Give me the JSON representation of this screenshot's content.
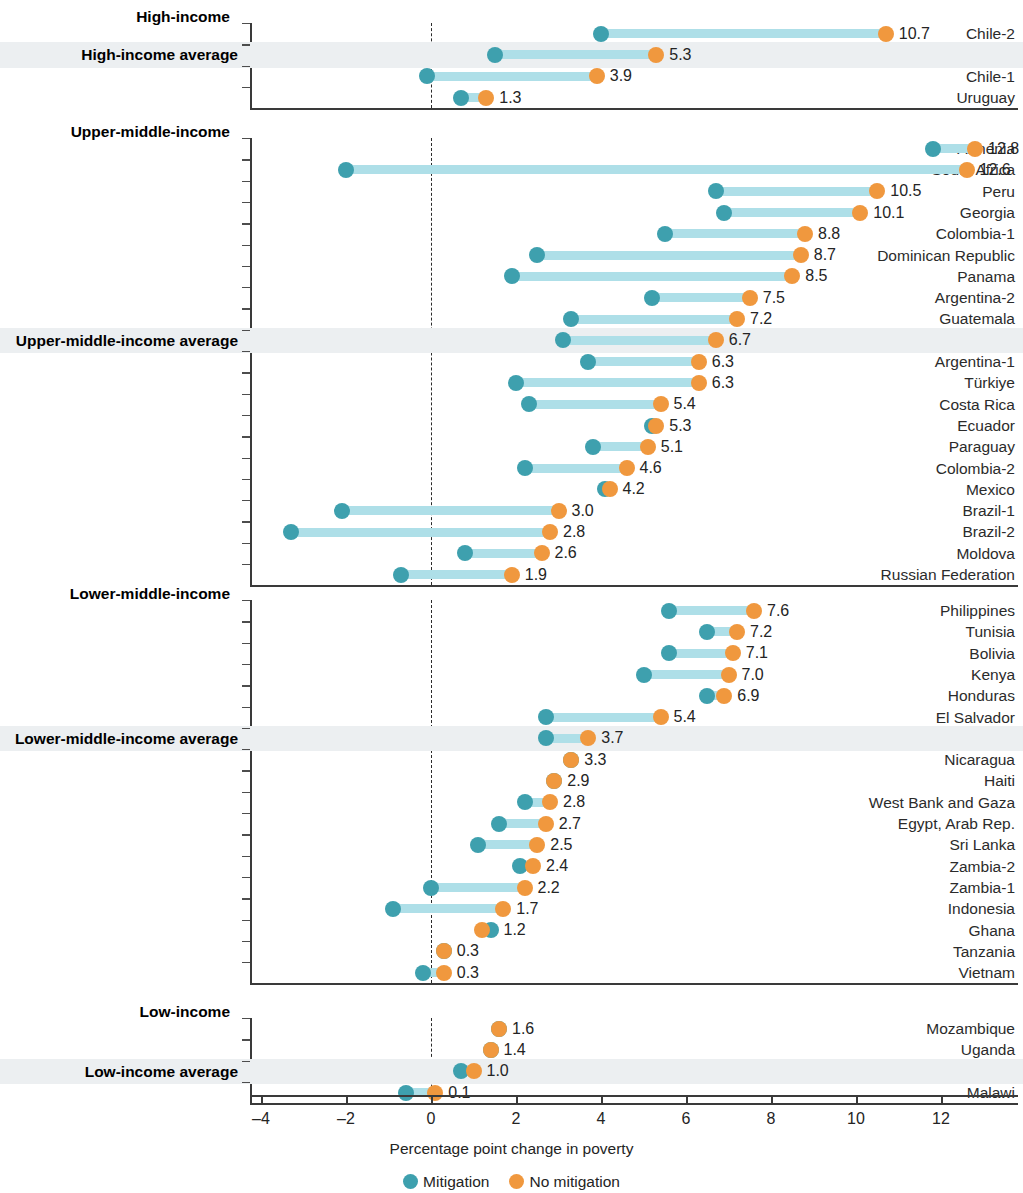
{
  "chart_data": {
    "type": "dumbbell",
    "title": "",
    "xlabel": "Percentage point change in poverty",
    "ylabel": "",
    "xlim": [
      -4.6,
      13.3
    ],
    "xticks": [
      -4,
      -2,
      0,
      2,
      4,
      6,
      8,
      10,
      12
    ],
    "xticklabels": [
      "–4",
      "–2",
      "0",
      "2",
      "4",
      "6",
      "8",
      "10",
      "12"
    ],
    "grid": false,
    "zero_reference_line": true,
    "legend_position": "bottom",
    "series": [
      {
        "name": "Mitigation",
        "color": "#3ea0ae"
      },
      {
        "name": "No mitigation",
        "color": "#f0983e"
      }
    ],
    "connector_color": "#aedfe8",
    "highlight_band_color": "#eceff1",
    "groups": [
      {
        "name": "High-income",
        "rows": [
          {
            "label": "Chile-2",
            "mitigation": 4.0,
            "no_mitigation": 10.7,
            "value_label": "10.7",
            "average": false
          },
          {
            "label": "High-income average",
            "mitigation": 1.5,
            "no_mitigation": 5.3,
            "value_label": "5.3",
            "average": true
          },
          {
            "label": "Chile-1",
            "mitigation": -0.1,
            "no_mitigation": 3.9,
            "value_label": "3.9",
            "average": false
          },
          {
            "label": "Uruguay",
            "mitigation": 0.7,
            "no_mitigation": 1.3,
            "value_label": "1.3",
            "average": false
          }
        ]
      },
      {
        "name": "Upper-middle-income",
        "rows": [
          {
            "label": "Armenia",
            "mitigation": 11.8,
            "no_mitigation": 12.8,
            "value_label": "12.8",
            "average": false
          },
          {
            "label": "South Africa",
            "mitigation": -2.0,
            "no_mitigation": 12.6,
            "value_label": "12.6",
            "average": false
          },
          {
            "label": "Peru",
            "mitigation": 6.7,
            "no_mitigation": 10.5,
            "value_label": "10.5",
            "average": false
          },
          {
            "label": "Georgia",
            "mitigation": 6.9,
            "no_mitigation": 10.1,
            "value_label": "10.1",
            "average": false
          },
          {
            "label": "Colombia-1",
            "mitigation": 5.5,
            "no_mitigation": 8.8,
            "value_label": "8.8",
            "average": false
          },
          {
            "label": "Dominican Republic",
            "mitigation": 2.5,
            "no_mitigation": 8.7,
            "value_label": "8.7",
            "average": false
          },
          {
            "label": "Panama",
            "mitigation": 1.9,
            "no_mitigation": 8.5,
            "value_label": "8.5",
            "average": false
          },
          {
            "label": "Argentina-2",
            "mitigation": 5.2,
            "no_mitigation": 7.5,
            "value_label": "7.5",
            "average": false
          },
          {
            "label": "Guatemala",
            "mitigation": 3.3,
            "no_mitigation": 7.2,
            "value_label": "7.2",
            "average": false
          },
          {
            "label": "Upper-middle-income average",
            "mitigation": 3.1,
            "no_mitigation": 6.7,
            "value_label": "6.7",
            "average": true
          },
          {
            "label": "Argentina-1",
            "mitigation": 3.7,
            "no_mitigation": 6.3,
            "value_label": "6.3",
            "average": false
          },
          {
            "label": "Türkiye",
            "mitigation": 2.0,
            "no_mitigation": 6.3,
            "value_label": "6.3",
            "average": false
          },
          {
            "label": "Costa Rica",
            "mitigation": 2.3,
            "no_mitigation": 5.4,
            "value_label": "5.4",
            "average": false
          },
          {
            "label": "Ecuador",
            "mitigation": 5.2,
            "no_mitigation": 5.3,
            "value_label": "5.3",
            "average": false
          },
          {
            "label": "Paraguay",
            "mitigation": 3.8,
            "no_mitigation": 5.1,
            "value_label": "5.1",
            "average": false
          },
          {
            "label": "Colombia-2",
            "mitigation": 2.2,
            "no_mitigation": 4.6,
            "value_label": "4.6",
            "average": false
          },
          {
            "label": "Mexico",
            "mitigation": 4.1,
            "no_mitigation": 4.2,
            "value_label": "4.2",
            "average": false
          },
          {
            "label": "Brazil-1",
            "mitigation": -2.1,
            "no_mitigation": 3.0,
            "value_label": "3.0",
            "average": false
          },
          {
            "label": "Brazil-2",
            "mitigation": -3.3,
            "no_mitigation": 2.8,
            "value_label": "2.8",
            "average": false
          },
          {
            "label": "Moldova",
            "mitigation": 0.8,
            "no_mitigation": 2.6,
            "value_label": "2.6",
            "average": false
          },
          {
            "label": "Russian Federation",
            "mitigation": -0.7,
            "no_mitigation": 1.9,
            "value_label": "1.9",
            "average": false
          }
        ]
      },
      {
        "name": "Lower-middle-income",
        "rows": [
          {
            "label": "Philippines",
            "mitigation": 5.6,
            "no_mitigation": 7.6,
            "value_label": "7.6",
            "average": false
          },
          {
            "label": "Tunisia",
            "mitigation": 6.5,
            "no_mitigation": 7.2,
            "value_label": "7.2",
            "average": false
          },
          {
            "label": "Bolivia",
            "mitigation": 5.6,
            "no_mitigation": 7.1,
            "value_label": "7.1",
            "average": false
          },
          {
            "label": "Kenya",
            "mitigation": 5.0,
            "no_mitigation": 7.0,
            "value_label": "7.0",
            "average": false
          },
          {
            "label": "Honduras",
            "mitigation": 6.5,
            "no_mitigation": 6.9,
            "value_label": "6.9",
            "average": false
          },
          {
            "label": "El Salvador",
            "mitigation": 2.7,
            "no_mitigation": 5.4,
            "value_label": "5.4",
            "average": false
          },
          {
            "label": "Lower-middle-income average",
            "mitigation": 2.7,
            "no_mitigation": 3.7,
            "value_label": "3.7",
            "average": true
          },
          {
            "label": "Nicaragua",
            "mitigation": 3.3,
            "no_mitigation": 3.3,
            "value_label": "3.3",
            "average": false
          },
          {
            "label": "Haiti",
            "mitigation": 2.9,
            "no_mitigation": 2.9,
            "value_label": "2.9",
            "average": false
          },
          {
            "label": "West Bank and Gaza",
            "mitigation": 2.2,
            "no_mitigation": 2.8,
            "value_label": "2.8",
            "average": false
          },
          {
            "label": "Egypt, Arab Rep.",
            "mitigation": 1.6,
            "no_mitigation": 2.7,
            "value_label": "2.7",
            "average": false
          },
          {
            "label": "Sri Lanka",
            "mitigation": 1.1,
            "no_mitigation": 2.5,
            "value_label": "2.5",
            "average": false
          },
          {
            "label": "Zambia-2",
            "mitigation": 2.1,
            "no_mitigation": 2.4,
            "value_label": "2.4",
            "average": false
          },
          {
            "label": "Zambia-1",
            "mitigation": 0.0,
            "no_mitigation": 2.2,
            "value_label": "2.2",
            "average": false
          },
          {
            "label": "Indonesia",
            "mitigation": -0.9,
            "no_mitigation": 1.7,
            "value_label": "1.7",
            "average": false
          },
          {
            "label": "Ghana",
            "mitigation": 1.4,
            "no_mitigation": 1.2,
            "value_label": "1.2",
            "average": false
          },
          {
            "label": "Tanzania",
            "mitigation": 0.3,
            "no_mitigation": 0.3,
            "value_label": "0.3",
            "average": false
          },
          {
            "label": "Vietnam",
            "mitigation": -0.2,
            "no_mitigation": 0.3,
            "value_label": "0.3",
            "average": false
          }
        ]
      },
      {
        "name": "Low-income",
        "rows": [
          {
            "label": "Mozambique",
            "mitigation": 1.6,
            "no_mitigation": 1.6,
            "value_label": "1.6",
            "average": false
          },
          {
            "label": "Uganda",
            "mitigation": 1.4,
            "no_mitigation": 1.4,
            "value_label": "1.4",
            "average": false
          },
          {
            "label": "Low-income average",
            "mitigation": 0.7,
            "no_mitigation": 1.0,
            "value_label": "1.0",
            "average": true
          },
          {
            "label": "Malawi",
            "mitigation": -0.6,
            "no_mitigation": 0.1,
            "value_label": "0.1",
            "average": false
          }
        ]
      }
    ]
  }
}
